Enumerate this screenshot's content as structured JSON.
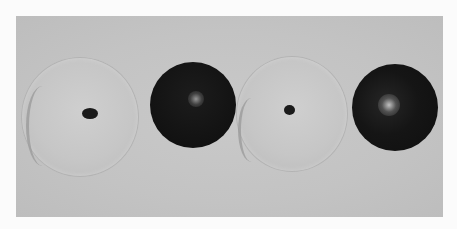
{
  "image": {
    "description": "Grayscale photograph of four spherical objects in a row on a gray background",
    "objects": [
      {
        "name": "light-disc-1",
        "tone": "light",
        "feature": "small dark central spot, crescent edge on left"
      },
      {
        "name": "dark-sphere-1",
        "tone": "dark",
        "feature": "soft central highlight"
      },
      {
        "name": "light-disc-2",
        "tone": "light",
        "feature": "small dark central spot, crescent edge on left"
      },
      {
        "name": "dark-sphere-2",
        "tone": "dark",
        "feature": "soft highlight, upper-left of center"
      }
    ],
    "colors": {
      "border": "#fbfbfb",
      "background": "#c4c4c4",
      "light_object": "#c8c8c8",
      "dark_object": "#141414",
      "spot": "#1a1a1a"
    }
  }
}
